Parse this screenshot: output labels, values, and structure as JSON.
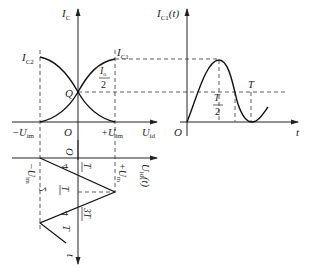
{
  "figure": {
    "left_chart": {
      "y_axis_label": "I",
      "y_axis_sub": "C",
      "x_axis_label": "U",
      "x_axis_sub": "id",
      "origin": "O",
      "curve_labels": {
        "ic1": {
          "main": "I",
          "sub": "C1"
        },
        "ic2": {
          "main": "I",
          "sub": "C2"
        },
        "q": "Q",
        "half_current_num": "I",
        "half_current_num_sub": "o",
        "half_current_den": "2"
      },
      "x_ticks": {
        "neg": {
          "prefix": "−U",
          "sub": "im"
        },
        "pos": {
          "prefix": "+U",
          "sub": "im"
        }
      }
    },
    "right_chart": {
      "y_axis_label": "I",
      "y_axis_sub": "C1",
      "y_axis_suffix": "(t)",
      "x_axis_label": "t",
      "origin": "O",
      "tick_half_num": "T",
      "tick_half_den": "2",
      "tick_T": "T"
    },
    "lower_chart": {
      "x_axis_label": "U",
      "x_axis_sub": "id",
      "x_axis_suffix": "(t)",
      "t_axis_label": "t",
      "origin": "O",
      "neg_label": {
        "prefix": "−U",
        "sub": "im"
      },
      "pos_label": {
        "prefix": "+U",
        "sub": "m"
      },
      "tick_quarter_num": "T",
      "tick_quarter_den": "4",
      "tick_half_num": "T",
      "tick_half_den": "2",
      "tick_3quarter_num": "3T",
      "tick_3quarter_den": "4",
      "tick_T": "T"
    }
  }
}
